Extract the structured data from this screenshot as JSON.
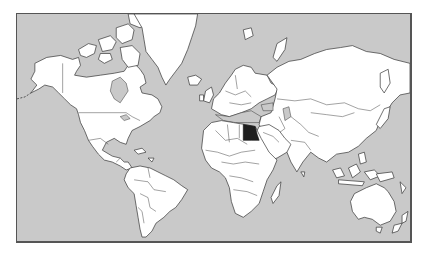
{
  "map": {
    "type": "world-political-outline",
    "projection": "mercator",
    "highlighted_country": "Egypt",
    "colors": {
      "ocean": "#c9c9c9",
      "land": "#ffffff",
      "border": "#333333",
      "highlight": "#1e1e1e",
      "frame": "#555555"
    }
  }
}
